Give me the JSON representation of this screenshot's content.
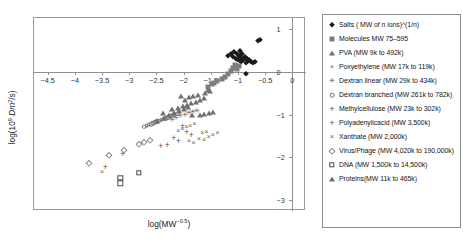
{
  "chart_data": {
    "type": "scatter",
    "title": "",
    "xlabel": "log(MW^-0.5)",
    "ylabel": "log(10^9 Dm^2/s)",
    "xlim": [
      -4.75,
      0.25
    ],
    "ylim": [
      -3.25,
      1.25
    ],
    "xticks": [
      -4.5,
      -4,
      -3.5,
      -3,
      -2.5,
      -2,
      -1.5,
      -1,
      -0.5,
      0
    ],
    "xticklabels": [
      "-4.5",
      "-4",
      "-3.5",
      "-3",
      "-2.5",
      "-2",
      "-1.5",
      "-1",
      "-0.5",
      "0"
    ],
    "yticks": [
      1,
      0,
      -1,
      -2,
      -3
    ],
    "yticklabels": [
      "1",
      "0",
      "-1",
      "-2",
      "-3"
    ],
    "y_axis_position": "right",
    "x_axis_position": "zero",
    "grid": false,
    "legend_position": "outside-right",
    "series": [
      {
        "name": "Salts ( MW of n ions)^(1/n)",
        "marker": "filled-diamond",
        "color": "#1a1a1a",
        "points": [
          [
            -1.18,
            0.37
          ],
          [
            -1.13,
            0.41
          ],
          [
            -1.1,
            0.33
          ],
          [
            -1.07,
            0.45
          ],
          [
            -1.04,
            0.3
          ],
          [
            -1.02,
            0.4
          ],
          [
            -1.0,
            0.26
          ],
          [
            -0.99,
            0.36
          ],
          [
            -0.97,
            0.47
          ],
          [
            -0.95,
            0.22
          ],
          [
            -0.94,
            0.32
          ],
          [
            -0.92,
            0.41
          ],
          [
            -0.9,
            0.28
          ],
          [
            -0.88,
            0.35
          ],
          [
            -0.86,
            0.2
          ],
          [
            -0.84,
            0.3
          ],
          [
            -0.82,
            0.24
          ],
          [
            -0.79,
            0.27
          ],
          [
            -0.76,
            0.22
          ],
          [
            -0.72,
            0.19
          ],
          [
            -0.69,
            0.23
          ],
          [
            -0.64,
            0.72
          ],
          [
            -0.6,
            0.73
          ],
          [
            -0.85,
            -0.05
          ]
        ]
      },
      {
        "name": "Molecules MW 75-595",
        "marker": "filled-square",
        "color": "#7d7d7d",
        "points": [
          [
            -1.48,
            -0.29
          ],
          [
            -1.39,
            -0.22
          ],
          [
            -1.3,
            -0.17
          ],
          [
            -1.24,
            -0.12
          ],
          [
            -1.18,
            -0.05
          ],
          [
            -1.13,
            0.02
          ],
          [
            -1.09,
            0.09
          ],
          [
            -1.05,
            0.15
          ],
          [
            -1.02,
            0.07
          ],
          [
            -0.99,
            0.13
          ],
          [
            -1.56,
            -0.36
          ],
          [
            -1.44,
            -0.26
          ]
        ]
      },
      {
        "name": "PVA (MW 9k to 492k)",
        "marker": "open-triangle",
        "color": "#6f6f6f",
        "points": [
          [
            -2.48,
            -1.16
          ],
          [
            -2.36,
            -1.08
          ],
          [
            -2.27,
            -1.02
          ],
          [
            -2.18,
            -0.97
          ],
          [
            -2.09,
            -0.92
          ],
          [
            -2.0,
            -0.88
          ],
          [
            -1.92,
            -0.83
          ]
        ]
      },
      {
        "name": "Poxyethylene (MW 17k to 119k)",
        "marker": "x",
        "color": "#5f5f5f",
        "points": [
          [
            -2.1,
            -1.38
          ],
          [
            -2.02,
            -1.34
          ],
          [
            -1.95,
            -1.3
          ],
          [
            -1.88,
            -1.26
          ],
          [
            -1.8,
            -1.22
          ],
          [
            -1.72,
            -1.56
          ],
          [
            -1.62,
            -1.6
          ],
          [
            -1.54,
            -1.52
          ],
          [
            -1.46,
            -1.48
          ],
          [
            -1.38,
            -1.44
          ],
          [
            -1.9,
            -1.62
          ],
          [
            -1.82,
            -1.66
          ]
        ]
      },
      {
        "name": "Dextran linear (MW 29k to 434k)",
        "marker": "asterisk",
        "color": "#5f5f5f",
        "points": [
          [
            -2.22,
            -1.12
          ],
          [
            -2.14,
            -1.08
          ],
          [
            -2.06,
            -1.04
          ],
          [
            -1.98,
            -1.0
          ],
          [
            -1.9,
            -0.97
          ],
          [
            -1.83,
            -0.94
          ],
          [
            -1.76,
            -0.91
          ]
        ]
      },
      {
        "name": "Dextran branched (MW 261k to 782k)",
        "marker": "open-circle",
        "color": "#6f6f6f",
        "points": [
          [
            -2.72,
            -1.28
          ],
          [
            -2.68,
            -1.26
          ],
          [
            -2.64,
            -1.24
          ],
          [
            -2.6,
            -1.22
          ],
          [
            -2.56,
            -1.2
          ],
          [
            -2.52,
            -1.18
          ],
          [
            -2.48,
            -1.16
          ],
          [
            -2.44,
            -1.14
          ],
          [
            -2.4,
            -1.12
          ],
          [
            -2.36,
            -1.1
          ],
          [
            -2.32,
            -1.08
          ],
          [
            -2.28,
            -1.06
          ],
          [
            -2.24,
            -1.04
          ],
          [
            -2.2,
            -1.02
          ],
          [
            -2.16,
            -1.0
          ],
          [
            -2.12,
            -0.98
          ]
        ]
      },
      {
        "name": "Methylcellulose (MW 23k to 302k)",
        "marker": "plus",
        "color": "#4a4a4a",
        "points": [
          [
            -2.02,
            -1.26
          ],
          [
            -1.94,
            -1.4
          ],
          [
            -2.18,
            -1.55
          ],
          [
            -2.1,
            -1.62
          ],
          [
            -2.3,
            -1.7
          ],
          [
            -2.42,
            -1.74
          ],
          [
            -1.86,
            -1.48
          ]
        ]
      },
      {
        "name": "Polyadenylicacid (MW 3,500k)",
        "marker": "plus",
        "color": "#4a4a4a",
        "points": [
          [
            -3.12,
            -1.92
          ],
          [
            -3.44,
            -2.22
          ]
        ]
      },
      {
        "name": "Xanthate (MW 2,000k)",
        "marker": "x",
        "color": "#5f5f5f",
        "points": [
          [
            -1.66,
            -1.44
          ],
          [
            -1.58,
            -1.4
          ],
          [
            -3.5,
            -2.35
          ]
        ]
      },
      {
        "name": "Virus/Phage (MW 4,020k to 190,000k)",
        "marker": "open-diamond",
        "color": "#8a8a8a",
        "points": [
          [
            -2.62,
            -1.6
          ],
          [
            -2.82,
            -1.68
          ],
          [
            -3.1,
            -1.82
          ],
          [
            -3.38,
            -1.94
          ],
          [
            -3.74,
            -2.12
          ],
          [
            -2.72,
            -1.64
          ]
        ]
      },
      {
        "name": "DNA (MW 1,500k to 14,500k)",
        "marker": "open-square",
        "color": "#4a4a4a",
        "points": [
          [
            -3.16,
            -2.48
          ],
          [
            -3.16,
            -2.6
          ],
          [
            -2.82,
            -2.36
          ]
        ]
      },
      {
        "name": "Proteins(MW 11k to 465k)",
        "marker": "open-triangle",
        "color": "#6f6f6f",
        "points": [
          [
            -2.22,
            -0.88
          ],
          [
            -2.1,
            -0.86
          ],
          [
            -2.02,
            -0.8
          ],
          [
            -1.94,
            -0.78
          ],
          [
            -1.86,
            -0.74
          ],
          [
            -1.78,
            -0.7
          ],
          [
            -1.7,
            -0.66
          ],
          [
            -1.62,
            -0.62
          ],
          [
            -2.38,
            -0.96
          ],
          [
            -1.9,
            -0.6
          ],
          [
            -1.82,
            -0.58
          ],
          [
            -1.74,
            -0.54
          ],
          [
            -1.6,
            -0.5
          ],
          [
            -1.52,
            -0.46
          ],
          [
            -1.56,
            -0.42
          ],
          [
            -1.98,
            -0.66
          ],
          [
            -1.84,
            -1.02
          ],
          [
            -1.7,
            -1.0
          ],
          [
            -1.62,
            -0.98
          ],
          [
            -1.54,
            -0.96
          ],
          [
            -1.46,
            -0.94
          ],
          [
            -2.04,
            -0.56
          ]
        ]
      }
    ]
  },
  "legend": {
    "items": [
      {
        "label": "Salts ( MW of n ions)^(1/n)",
        "marker": "filled-diamond"
      },
      {
        "label": "Molecules MW 75–595",
        "marker": "filled-square"
      },
      {
        "label": "PVA (MW 9k to 492k)",
        "marker": "open-triangle"
      },
      {
        "label": "Poxyethylene (MW 17k to 119k)",
        "marker": "x"
      },
      {
        "label": "Dextran linear (MW 29k to 434k)",
        "marker": "asterisk"
      },
      {
        "label": "Dextran branched (MW 261k to 782k)",
        "marker": "open-circle"
      },
      {
        "label": "Methylcellulose (MW 23k to 302k)",
        "marker": "plus"
      },
      {
        "label": "Polyadenylicacid (MW 3,500k)",
        "marker": "plus"
      },
      {
        "label": "Xanthate (MW 2,000k)",
        "marker": "x"
      },
      {
        "label": "Virus/Phage (MW 4,020k to 190,000k)",
        "marker": "open-diamond"
      },
      {
        "label": "DNA (MW 1,500k to 14,500k)",
        "marker": "open-square"
      },
      {
        "label": "Proteins(MW 11k to 465k)",
        "marker": "open-triangle"
      }
    ]
  }
}
